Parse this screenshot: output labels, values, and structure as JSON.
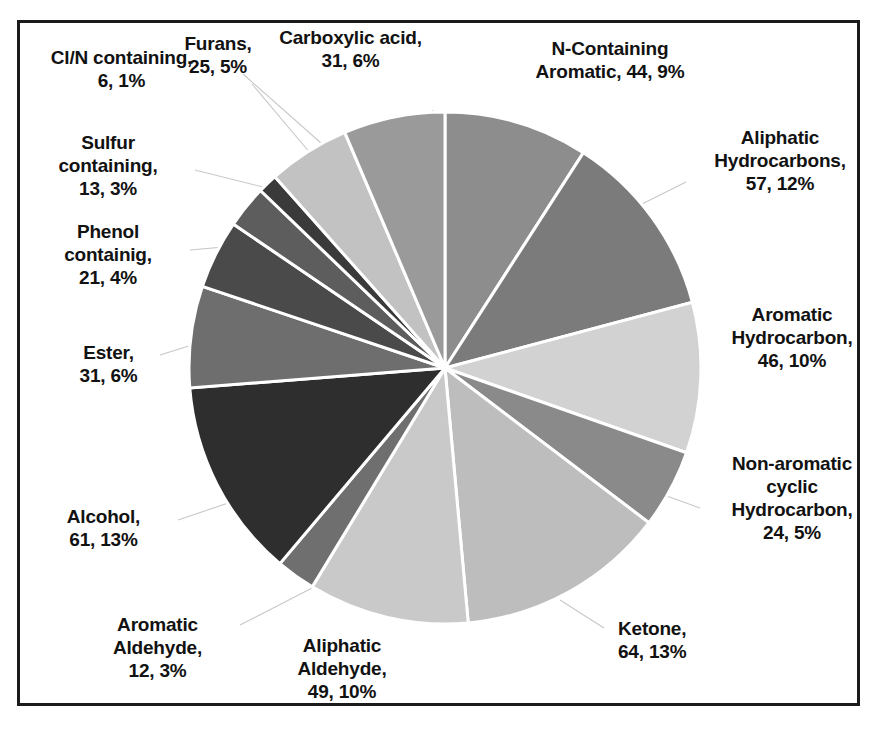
{
  "chart_data": {
    "type": "pie",
    "title": "",
    "subtitle": "",
    "xlabel": "",
    "ylabel": "",
    "legend_position": "none",
    "grid": false,
    "total": 484,
    "label_format": "name, count, percent",
    "start_angle_deg": 0,
    "direction": "clockwise",
    "categories": [
      "N-Containing Aromatic",
      "Aliphatic Hydrocarbons",
      "Aromatic Hydrocarbon",
      "Non-aromatic cyclic Hydrocarbon",
      "Ketone",
      "Aliphatic Aldehyde",
      "Aromatic Aldehyde",
      "Alcohol",
      "Ester",
      "Phenol containig",
      "Sulfur containing",
      "Cl/N containing",
      "Furans",
      "Carboxylic acid"
    ],
    "values": [
      44,
      57,
      46,
      24,
      64,
      49,
      12,
      61,
      31,
      21,
      13,
      6,
      25,
      31
    ],
    "percents": [
      9,
      12,
      10,
      5,
      13,
      10,
      3,
      13,
      6,
      4,
      3,
      1,
      5,
      6
    ],
    "colors": [
      "#8d8d8d",
      "#7b7b7b",
      "#d2d2d2",
      "#8a8a8a",
      "#bdbdbd",
      "#c9c9c9",
      "#6f6f6f",
      "#2e2e2e",
      "#6e6e6e",
      "#4a4a4a",
      "#5d5d5d",
      "#3a3a3a",
      "#c2c2c2",
      "#9a9a9a"
    ],
    "slice_border_color": "#ffffff",
    "labels": [
      "N-Containing Aromatic, 44, 9%",
      "Aliphatic Hydrocarbons, 57, 12%",
      "Aromatic Hydrocarbon, 46, 10%",
      "Non-aromatic cyclic Hydrocarbon, 24, 5%",
      "Ketone, 64, 13%",
      "Aliphatic Aldehyde, 49, 10%",
      "Aromatic Aldehyde, 12, 3%",
      "Alcohol, 61, 13%",
      "Ester, 31, 6%",
      "Phenol containig, 21, 4%",
      "Sulfur containing, 13, 3%",
      "Cl/N containing, 6, 1%",
      "Furans, 25, 5%",
      "Carboxylic acid, 31, 6%"
    ]
  },
  "labels": {
    "n_containing_aromatic": "N-Containing\nAromatic, 44, 9%",
    "aliphatic_hydrocarbons": "Aliphatic\nHydrocarbons,\n57, 12%",
    "aromatic_hydrocarbon": "Aromatic\nHydrocarbon,\n46, 10%",
    "non_aromatic_cyclic": "Non-aromatic\ncyclic\nHydrocarbon,\n24, 5%",
    "ketone": "Ketone,\n64, 13%",
    "aliphatic_aldehyde": "Aliphatic\nAldehyde,\n49, 10%",
    "aromatic_aldehyde": "Aromatic\nAldehyde,\n12, 3%",
    "alcohol": "Alcohol,\n61, 13%",
    "ester": "Ester,\n31, 6%",
    "phenol_containing": "Phenol\ncontainig,\n21, 4%",
    "sulfur_containing": "Sulfur\ncontaining,\n13, 3%",
    "cl_n_containing": "Cl/N containing,\n6, 1%",
    "furans": "Furans,\n25, 5%",
    "carboxylic_acid": "Carboxylic acid,\n31, 6%"
  }
}
